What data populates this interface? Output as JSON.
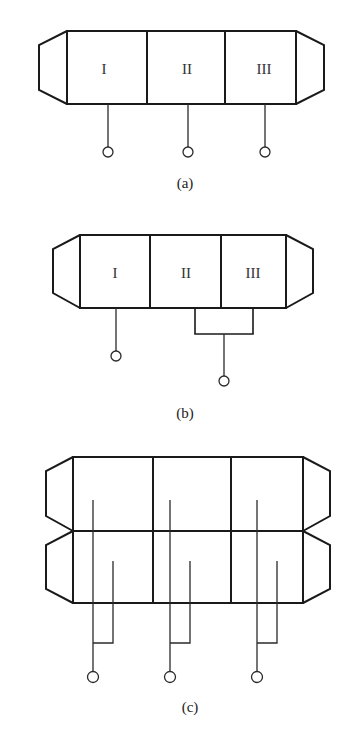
{
  "figures": [
    {
      "id": "a",
      "caption": "(a)",
      "sections": [
        "I",
        "II",
        "III"
      ],
      "description": "Three-section enclosure with tapered end caps; each section has its own individual terminal lead."
    },
    {
      "id": "b",
      "caption": "(b)",
      "sections": [
        "I",
        "II",
        "III"
      ],
      "description": "Three-section enclosure; section I has a separate terminal, sections II and III share one bridged terminal."
    },
    {
      "id": "c",
      "caption": "(c)",
      "sections": [],
      "description": "Two stacked three-section enclosures; each column pairs an upper and lower lead into a common terminal."
    }
  ],
  "colors": {
    "stroke": "#1a1a1a",
    "background": "#ffffff"
  }
}
